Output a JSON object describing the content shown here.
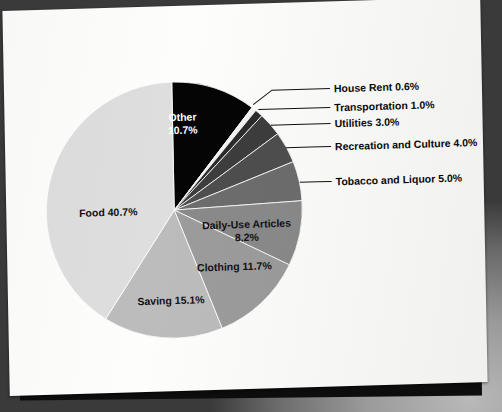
{
  "chart_data": {
    "type": "pie",
    "title": "",
    "legend_position": "callout-labels",
    "categories": [
      "Other",
      "House Rent",
      "Transportation",
      "Utilities",
      "Recreation and Culture",
      "Tobacco and Liquor",
      "Daily-Use Articles",
      "Clothing",
      "Saving",
      "Food"
    ],
    "values": [
      10.7,
      0.6,
      1.0,
      3.0,
      4.0,
      5.0,
      8.2,
      11.7,
      15.1,
      40.7
    ],
    "unit": "%",
    "slices": [
      {
        "name": "Other",
        "value": 10.7,
        "label": "Other",
        "value_label": "10.7%",
        "color": "#050505",
        "label_placement": "inside",
        "text_color": "light"
      },
      {
        "name": "House Rent",
        "value": 0.6,
        "label": "House Rent",
        "value_label": "0.6%",
        "color": "#f2f2f0",
        "label_placement": "callout",
        "text_color": "dark"
      },
      {
        "name": "Transportation",
        "value": 1.0,
        "label": "Transportation",
        "value_label": "1.0%",
        "color": "#2b2b2b",
        "label_placement": "callout",
        "text_color": "dark"
      },
      {
        "name": "Utilities",
        "value": 3.0,
        "label": "Utilities",
        "value_label": "3.0%",
        "color": "#3d3d3d",
        "label_placement": "callout",
        "text_color": "dark"
      },
      {
        "name": "Recreation and Culture",
        "value": 4.0,
        "label": "Recreation and Culture",
        "value_label": "4.0%",
        "color": "#4e4e4e",
        "label_placement": "callout",
        "text_color": "dark"
      },
      {
        "name": "Tobacco and Liquor",
        "value": 5.0,
        "label": "Tobacco and Liquor",
        "value_label": "5.0%",
        "color": "#6d6d6d",
        "label_placement": "callout",
        "text_color": "dark"
      },
      {
        "name": "Daily-Use Articles",
        "value": 8.2,
        "label": "Daily-Use Articles",
        "value_label": "8.2%",
        "color": "#8a8a8a",
        "label_placement": "inside",
        "text_color": "dark"
      },
      {
        "name": "Clothing",
        "value": 11.7,
        "label": "Clothing",
        "value_label": "11.7%",
        "color": "#9c9c9c",
        "label_placement": "inside",
        "text_color": "dark"
      },
      {
        "name": "Saving",
        "value": 15.1,
        "label": "Saving",
        "value_label": "15.1%",
        "color": "#bcbcbc",
        "label_placement": "inside",
        "text_color": "dark"
      },
      {
        "name": "Food",
        "value": 40.7,
        "label": "Food",
        "value_label": "40.7%",
        "color": "#dedede",
        "label_placement": "inside",
        "text_color": "dark"
      }
    ]
  },
  "labels": {
    "other": "Other",
    "other_value": "10.7%",
    "food": "Food 40.7%",
    "saving": "Saving 15.1%",
    "clothing": "Clothing 11.7%",
    "daily_use": "Daily-Use Articles",
    "daily_use_value": "8.2%",
    "house_rent": "House Rent 0.6%",
    "transportation": "Transportation 1.0%",
    "utilities": "Utilities 3.0%",
    "recreation": "Recreation and Culture 4.0%",
    "tobacco": "Tobacco and Liquor 5.0%"
  },
  "colors": {
    "paper": "#fdfdfb",
    "backdrop": "#0d0d0d",
    "text": "#0a0a0a"
  }
}
